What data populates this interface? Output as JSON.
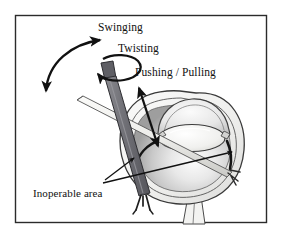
{
  "figure": {
    "kind": "surgical-instrument-motion-diagram",
    "background_color": "#ffffff",
    "border_color": "#2b2b2b",
    "ink_color": "#111111"
  },
  "frame": {
    "x": 15,
    "y": 15,
    "width": 252,
    "height": 208,
    "stroke_width": 1.5
  },
  "labels": {
    "swinging": "Swinging",
    "twisting": "Twisting",
    "pushing_pulling": "Pushing / Pulling",
    "inoperable_area": "Inoperable area"
  },
  "anatomy": {
    "globe_label": "eye-globe",
    "cornea_label": "cornea",
    "lens_label": "lens",
    "sclera_label": "sclera",
    "vitreous_label": "vitreous-body",
    "optic_nerve_label": "optic-nerve",
    "inoperable_band_label": "inoperable-band"
  },
  "instruments": {
    "primary_label": "primary-surgical-instrument",
    "primary_color": "#6f6f74",
    "primary_handle_color": "#5f5f65",
    "secondary_label": "secondary-surgical-instrument",
    "secondary_color": "#e2e2e0"
  },
  "motions": [
    {
      "id": "swinging",
      "name": "Swinging",
      "arrow": "curved-double-headed"
    },
    {
      "id": "twisting",
      "name": "Twisting",
      "arrow": "circular-rotation"
    },
    {
      "id": "pushing-pulling",
      "name": "Pushing / Pulling",
      "arrow": "straight-double-headed"
    }
  ],
  "colors": {
    "sclera_fill": "#f2f2f0",
    "globe_fill_light": "#fbfbfb",
    "globe_fill_mid": "#d6d6d6",
    "globe_fill_dark": "#a8a8a8",
    "cornea_fill": "#eeeeee",
    "lens_fill": "#f4f4f2",
    "outline": "#333333",
    "band": "#1a1a1a"
  }
}
